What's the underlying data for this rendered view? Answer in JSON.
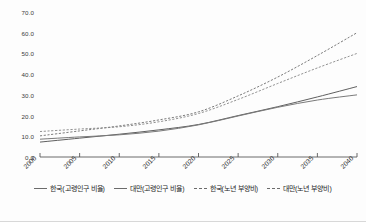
{
  "chart_data": {
    "type": "line",
    "title": "",
    "xlabel": "",
    "ylabel": "",
    "x": [
      2000,
      2005,
      2010,
      2015,
      2020,
      2025,
      2030,
      2035,
      2040
    ],
    "xtick_labels": [
      "2000",
      "2005",
      "2010",
      "2015",
      "2020",
      "2025",
      "2030",
      "2035",
      "2040"
    ],
    "ytick_labels": [
      "0.0",
      "10.0",
      "20.0",
      "30.0",
      "40.0",
      "50.0",
      "60.0",
      "70.0"
    ],
    "ytick_values": [
      0.0,
      10.0,
      20.0,
      30.0,
      40.0,
      50.0,
      60.0,
      70.0
    ],
    "xlim": [
      2000,
      2040
    ],
    "ylim": [
      0.0,
      70.0
    ],
    "grid": false,
    "legend_position": "bottom",
    "series": [
      {
        "name": "한국(고령인구 비율)",
        "style": "solid",
        "color": "#5f5f5f",
        "values": [
          7.2,
          9.1,
          11.0,
          13.1,
          15.7,
          20.0,
          24.3,
          29.0,
          34.0
        ]
      },
      {
        "name": "대만(고령인구 비율)",
        "style": "solid",
        "color": "#7a7a7a",
        "values": [
          8.6,
          9.7,
          10.7,
          12.5,
          15.5,
          19.8,
          24.0,
          27.5,
          30.0
        ]
      },
      {
        "name": "한국(노년 부양비)",
        "style": "dashed",
        "color": "#6d6d6d",
        "values": [
          10.2,
          12.6,
          15.0,
          17.9,
          21.8,
          29.5,
          38.6,
          49.0,
          60.0
        ]
      },
      {
        "name": "대만(노년 부양비)",
        "style": "dashed",
        "color": "#868686",
        "values": [
          12.3,
          13.5,
          14.6,
          17.0,
          21.0,
          27.8,
          35.5,
          43.0,
          50.0
        ]
      }
    ]
  },
  "legend": {
    "items": [
      {
        "label": "한국(고령인구 비율)",
        "style": "solid"
      },
      {
        "label": "대만(고령인구 비율)",
        "style": "solid"
      },
      {
        "label": "한국(노년 부양비)",
        "style": "dashed"
      },
      {
        "label": "대만(노년 부양비)",
        "style": "dashed"
      }
    ]
  }
}
